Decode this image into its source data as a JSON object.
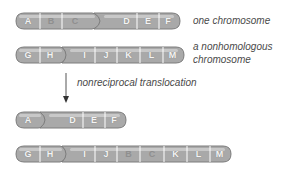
{
  "colors": {
    "chromosome_fill": "#a9a9a9",
    "chromosome_edge": "#7d7d7d",
    "highlight": "#d6d6d6",
    "divider": "#ffffff",
    "label": "#f4f4f4",
    "moved_label": "#8f8f8f",
    "caption": "#4a4a4a"
  },
  "captions": {
    "chromosome1": "one chromosome",
    "chromosome2_line1": "a nonhomologous",
    "chromosome2_line2": "chromosome",
    "process": "nonreciprocal translocation"
  },
  "chromosomes": [
    {
      "name": "original-chromosome-1",
      "segments": [
        "A",
        "B",
        "C",
        "D",
        "E",
        "F"
      ]
    },
    {
      "name": "original-chromosome-2",
      "segments": [
        "G",
        "H",
        "I",
        "J",
        "K",
        "L",
        "M"
      ]
    },
    {
      "name": "result-chromosome-1",
      "segments": [
        "A",
        "D",
        "E",
        "F"
      ]
    },
    {
      "name": "result-chromosome-2",
      "segments": [
        "G",
        "H",
        "I",
        "J",
        "B",
        "C",
        "K",
        "L",
        "M"
      ]
    }
  ]
}
